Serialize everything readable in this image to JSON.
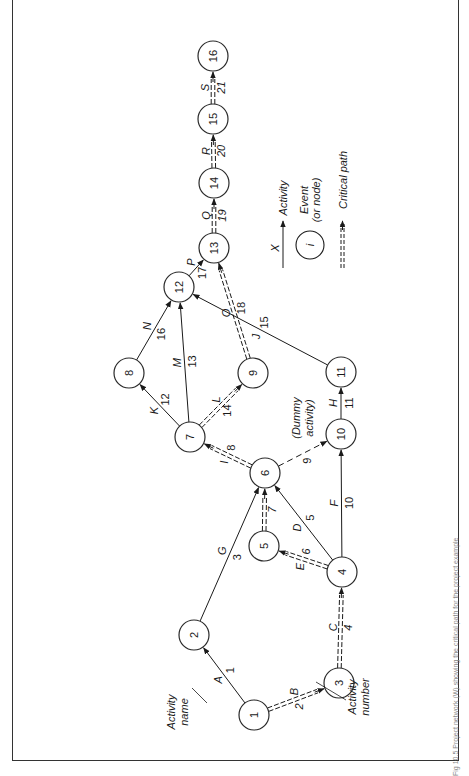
{
  "figure": {
    "caption": "Fig 10.5 Project network (W) showing the critical path for the project example",
    "legend": {
      "activity_symbol": "X",
      "activity_label": "Activity",
      "event_symbol": "i",
      "event_label_line1": "Event",
      "event_label_line2": "(or node)",
      "critical_label": "Critical path"
    },
    "annotations": {
      "activity_name_line1": "Activity",
      "activity_name_line2": "name",
      "activity_number_line1": "Activity",
      "activity_number_line2": "number",
      "dummy_line1": "(Dummy",
      "dummy_line2": "activity)"
    },
    "nodes": [
      {
        "id": "1",
        "x": 254,
        "y": 715
      },
      {
        "id": "2",
        "x": 194,
        "y": 635
      },
      {
        "id": "3",
        "x": 339,
        "y": 683
      },
      {
        "id": "4",
        "x": 342,
        "y": 572
      },
      {
        "id": "5",
        "x": 264,
        "y": 546
      },
      {
        "id": "6",
        "x": 265,
        "y": 473
      },
      {
        "id": "7",
        "x": 190,
        "y": 437
      },
      {
        "id": "8",
        "x": 129,
        "y": 373
      },
      {
        "id": "9",
        "x": 253,
        "y": 373
      },
      {
        "id": "10",
        "x": 341,
        "y": 434
      },
      {
        "id": "11",
        "x": 341,
        "y": 372
      },
      {
        "id": "12",
        "x": 179,
        "y": 287
      },
      {
        "id": "13",
        "x": 214,
        "y": 248
      },
      {
        "id": "14",
        "x": 214,
        "y": 183
      },
      {
        "id": "15",
        "x": 213,
        "y": 119
      },
      {
        "id": "16",
        "x": 213,
        "y": 56
      }
    ],
    "activities": [
      {
        "name": "A",
        "number": "1",
        "from": "1",
        "to": "2",
        "critical": false
      },
      {
        "name": "B",
        "number": "2",
        "from": "1",
        "to": "3",
        "critical": true
      },
      {
        "name": "C",
        "number": "4",
        "from": "3",
        "to": "4",
        "critical": true
      },
      {
        "name": "G",
        "number": "3",
        "from": "2",
        "to": "6",
        "critical": false
      },
      {
        "name": "E",
        "number": "6",
        "from": "4",
        "to": "5",
        "critical": true
      },
      {
        "name": "D",
        "number": "5",
        "from": "4",
        "to": "6",
        "critical": false
      },
      {
        "name": "",
        "number": "7",
        "from": "5",
        "to": "6",
        "critical": true
      },
      {
        "name": "F",
        "number": "10",
        "from": "4",
        "to": "10",
        "critical": false
      },
      {
        "name": "I",
        "number": "8",
        "from": "6",
        "to": "7",
        "critical": true
      },
      {
        "name": "",
        "number": "9",
        "from": "6",
        "to": "10",
        "critical": false,
        "dummy": true
      },
      {
        "name": "H",
        "number": "11",
        "from": "10",
        "to": "11",
        "critical": false
      },
      {
        "name": "K",
        "number": "12",
        "from": "7",
        "to": "8",
        "critical": false
      },
      {
        "name": "M",
        "number": "13",
        "from": "7",
        "to": "12",
        "critical": false
      },
      {
        "name": "L",
        "number": "14",
        "from": "7",
        "to": "9",
        "critical": true
      },
      {
        "name": "J",
        "number": "15",
        "from": "11",
        "to": "12",
        "critical": false
      },
      {
        "name": "N",
        "number": "16",
        "from": "8",
        "to": "12",
        "critical": false
      },
      {
        "name": "P",
        "number": "17",
        "from": "12",
        "to": "13",
        "critical": false
      },
      {
        "name": "O",
        "number": "18",
        "from": "9",
        "to": "13",
        "critical": true
      },
      {
        "name": "Q",
        "number": "19",
        "from": "13",
        "to": "14",
        "critical": true
      },
      {
        "name": "R",
        "number": "20",
        "from": "14",
        "to": "15",
        "critical": true
      },
      {
        "name": "S",
        "number": "21",
        "from": "15",
        "to": "16",
        "critical": true
      }
    ]
  },
  "colors": {
    "ink": "#1a1a1a",
    "frame": "#333333",
    "background": "#ffffff"
  }
}
